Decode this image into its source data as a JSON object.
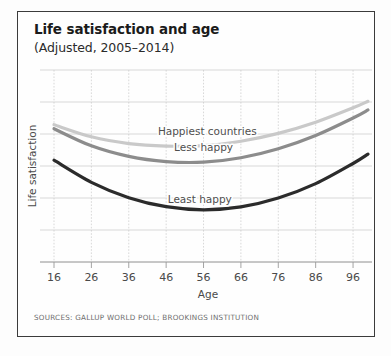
{
  "figure": {
    "title": "Life satisfaction and age",
    "subtitle": "(Adjusted, 2005–2014)",
    "source": "SOURCES: GALLUP WORLD POLL; BROOKINGS INSTITUTION",
    "border_color": "#3b3b3b",
    "background": "#fefefe"
  },
  "chart_data": {
    "type": "line",
    "title": "Life satisfaction and age",
    "subtitle": "(Adjusted, 2005–2014)",
    "xlabel": "Age",
    "ylabel": "Life satisfaction",
    "xlim": [
      16,
      100
    ],
    "ylim": [
      0,
      10
    ],
    "xticks": [
      16,
      26,
      36,
      46,
      56,
      66,
      76,
      86,
      96
    ],
    "xtick_labels": [
      "16",
      "26",
      "36",
      "46",
      "56",
      "66",
      "76",
      "86",
      "96"
    ],
    "yticks": [],
    "ytick_labels": [],
    "grid": true,
    "grid_color": "#c8c8c8",
    "legend": "inline-labels",
    "x": [
      16,
      26,
      36,
      46,
      56,
      66,
      76,
      86,
      96,
      100
    ],
    "series": [
      {
        "name": "Happiest countries",
        "color": "#c9c9c9",
        "label_x": 57,
        "label_y": 6.62,
        "values": [
          7.15,
          6.52,
          6.17,
          6.04,
          6.06,
          6.29,
          6.7,
          7.28,
          8.03,
          8.37
        ]
      },
      {
        "name": "Less happy",
        "color": "#8c8c8c",
        "label_x": 56,
        "label_y": 5.77,
        "values": [
          6.94,
          6.05,
          5.5,
          5.23,
          5.2,
          5.43,
          5.9,
          6.59,
          7.5,
          7.92
        ]
      },
      {
        "name": "Least happy",
        "color": "#2b2b2b",
        "label_x": 55,
        "label_y": 3.08,
        "values": [
          5.3,
          4.15,
          3.35,
          2.88,
          2.72,
          2.87,
          3.33,
          4.08,
          5.13,
          5.62
        ]
      }
    ],
    "annotations": [
      {
        "text": "Happiest countries",
        "series": "Happiest countries"
      },
      {
        "text": "Less happy",
        "series": "Less happy"
      },
      {
        "text": "Least happy",
        "series": "Least happy"
      }
    ]
  }
}
